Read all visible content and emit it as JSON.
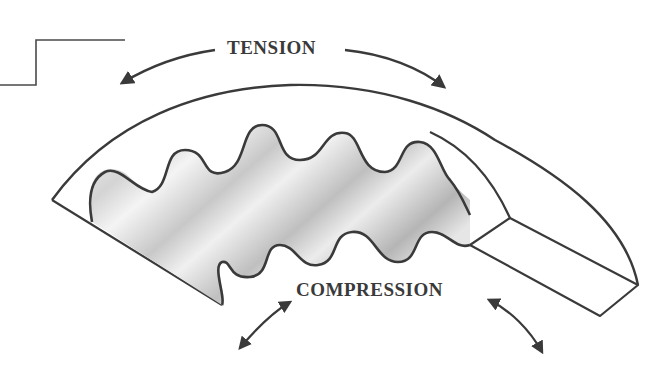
{
  "diagram": {
    "labels": {
      "tension": "TENSION",
      "compression": "COMPRESSION"
    },
    "colors": {
      "stroke": "#3a3a3a",
      "shade_dark": "#9a9a9a",
      "shade_light": "#e2e2e2",
      "background": "#ffffff"
    },
    "elements": [
      {
        "name": "step-line",
        "type": "leader"
      },
      {
        "name": "outer-arc-surface",
        "type": "tension-side"
      },
      {
        "name": "corrugated-teeth",
        "type": "compression-side"
      },
      {
        "name": "end-block",
        "type": "cross-section"
      },
      {
        "name": "tension-arrows",
        "direction": "outward"
      },
      {
        "name": "compression-arrows",
        "direction": "inward"
      }
    ]
  }
}
